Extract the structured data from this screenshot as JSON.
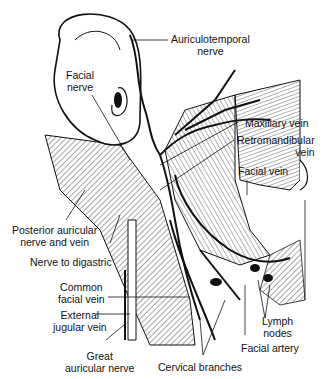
{
  "figure": {
    "labels": [
      {
        "id": "auriculotemporal",
        "lines": [
          "Auriculotemporal",
          "nerve"
        ]
      },
      {
        "id": "facial-nerve",
        "lines": [
          "Facial",
          "nerve"
        ]
      },
      {
        "id": "maxillary-vein",
        "lines": [
          "Maxillary vein"
        ]
      },
      {
        "id": "retromandibular-vein",
        "lines": [
          "Retromandibular",
          "vein"
        ]
      },
      {
        "id": "facial-vein",
        "lines": [
          "Facial vein"
        ]
      },
      {
        "id": "posterior-auricular",
        "lines": [
          "Posterior auricular",
          "nerve and vein"
        ]
      },
      {
        "id": "nerve-to-digastric",
        "lines": [
          "Nerve to digastric"
        ]
      },
      {
        "id": "common-facial-vein",
        "lines": [
          "Common",
          "facial vein"
        ]
      },
      {
        "id": "external-jugular",
        "lines": [
          "External",
          "jugular vein"
        ]
      },
      {
        "id": "lymph-nodes",
        "lines": [
          "Lymph",
          "nodes"
        ]
      },
      {
        "id": "facial-artery",
        "lines": [
          "Facial artery"
        ]
      },
      {
        "id": "great-auricular",
        "lines": [
          "Great",
          "auricular nerve"
        ]
      },
      {
        "id": "cervical-branches",
        "lines": [
          "Cervical branches"
        ]
      }
    ]
  }
}
